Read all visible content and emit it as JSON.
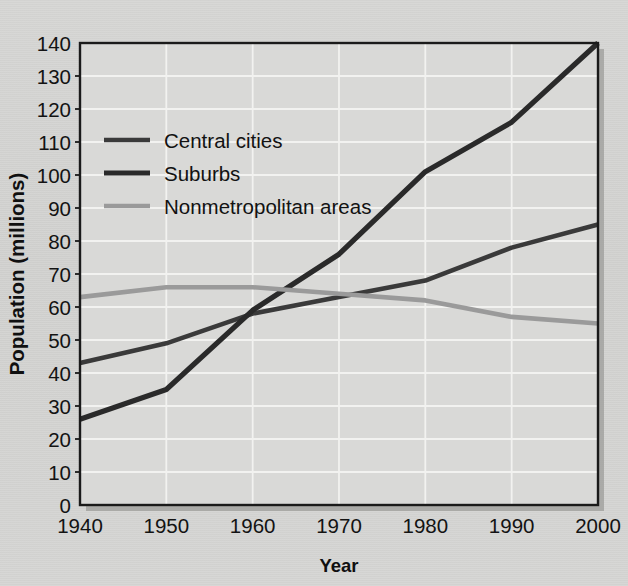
{
  "chart_data": {
    "type": "line",
    "title": "",
    "xlabel": "Year",
    "ylabel": "Population (millions)",
    "x": [
      1940,
      1950,
      1960,
      1970,
      1980,
      1990,
      2000
    ],
    "xtick_labels": [
      "1940",
      "1950",
      "1960",
      "1970",
      "1980",
      "1990",
      "2000"
    ],
    "ytick_labels": [
      "0",
      "10",
      "20",
      "30",
      "40",
      "50",
      "60",
      "70",
      "80",
      "90",
      "100",
      "110",
      "120",
      "130",
      "140"
    ],
    "yticks": [
      0,
      10,
      20,
      30,
      40,
      50,
      60,
      70,
      80,
      90,
      100,
      110,
      120,
      130,
      140
    ],
    "xlim": [
      1940,
      2000
    ],
    "ylim": [
      0,
      140
    ],
    "grid": "horizontal-and-vertical-white",
    "legend_position": "upper-left-inside",
    "series": [
      {
        "name": "Central cities",
        "color": "#3a3a3a",
        "width": 4.6,
        "values": [
          43,
          49,
          58,
          63,
          68,
          78,
          85
        ]
      },
      {
        "name": "Suburbs",
        "color": "#2a2a2a",
        "width": 5.2,
        "values": [
          26,
          35,
          59,
          76,
          101,
          116,
          140
        ]
      },
      {
        "name": "Nonmetropolitan areas",
        "color": "#9a9a9a",
        "width": 4.6,
        "values": [
          63,
          66,
          66,
          64,
          62,
          57,
          55
        ]
      }
    ]
  },
  "legend": {
    "items": [
      {
        "label": "Central cities"
      },
      {
        "label": "Suburbs"
      },
      {
        "label": "Nonmetropolitan areas"
      }
    ]
  },
  "axes": {
    "x_title": "Year",
    "y_title": "Population (millions)"
  },
  "colors": {
    "background": "#d4d4d2",
    "plot_background": "#d9d9d7",
    "gridline": "#f2f2f0",
    "frame": "#1a1a1a",
    "shadow": "#9b9b99"
  }
}
